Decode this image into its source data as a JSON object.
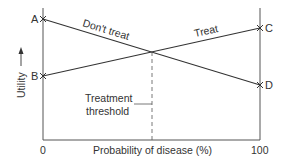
{
  "diagram": {
    "type": "decision-threshold-diagram",
    "y_axis_label": "Utility",
    "x_axis_label": "Probability of disease (%)",
    "x_ticks": [
      "0",
      "100"
    ],
    "points": {
      "A": {
        "label": "A",
        "side": "left",
        "y": 19
      },
      "B": {
        "label": "B",
        "side": "left",
        "y": 76
      },
      "C": {
        "label": "C",
        "side": "right",
        "y": 28
      },
      "D": {
        "label": "D",
        "side": "right",
        "y": 85
      }
    },
    "lines": [
      {
        "name": "dont-treat",
        "label": "Don't treat",
        "from": "A",
        "to": "D"
      },
      {
        "name": "treat",
        "label": "Treat",
        "from": "B",
        "to": "C"
      }
    ],
    "threshold": {
      "label_line1": "Treatment",
      "label_line2": "threshold"
    },
    "colors": {
      "line": "#333333",
      "axis": "#555555",
      "text": "#333333",
      "background": "#ffffff"
    }
  }
}
